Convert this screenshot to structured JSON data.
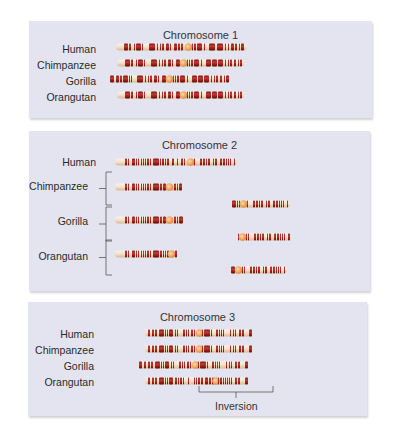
{
  "colors": {
    "panel_bg": "#e4e4f0",
    "band_dark": "#9b1c1c",
    "band_highlight": "#c8443a",
    "chromosome_light": "#f4e6d4",
    "centromere": "#f0a860",
    "bracket": "#555555"
  },
  "panels": [
    {
      "title": "Chromosome 1",
      "rows": [
        {
          "label": "Human"
        },
        {
          "label": "Chimpanzee"
        },
        {
          "label": "Gorilla"
        },
        {
          "label": "Orangutan"
        }
      ]
    },
    {
      "title": "Chromosome 2",
      "rows": [
        {
          "label": "Human",
          "bracket": false
        },
        {
          "label": "Chimpanzee",
          "bracket": true,
          "pieces": 2
        },
        {
          "label": "Gorilla",
          "bracket": true,
          "pieces": 2
        },
        {
          "label": "Orangutan",
          "bracket": true,
          "pieces": 2
        }
      ]
    },
    {
      "title": "Chromosome 3",
      "rows": [
        {
          "label": "Human"
        },
        {
          "label": "Chimpanzee"
        },
        {
          "label": "Gorilla"
        },
        {
          "label": "Orangutan"
        }
      ],
      "annotation": "Inversion"
    }
  ],
  "chromosomes": {
    "c1": {
      "Human": {
        "start": 0,
        "end": 1.0,
        "centromere": 0.47,
        "pattern": "A"
      },
      "Chimpanzee": {
        "start": 0,
        "end": 0.95,
        "centromere": 0.47,
        "pattern": "B"
      },
      "Gorilla": {
        "start": -0.02,
        "end": 0.96,
        "centromere": 0.47,
        "pattern": "B"
      },
      "Orangutan": {
        "start": 0,
        "end": 0.95,
        "centromere": 0.47,
        "pattern": "B"
      }
    }
  }
}
